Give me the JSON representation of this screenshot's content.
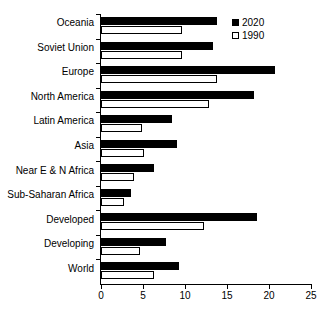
{
  "chart_data": {
    "type": "bar",
    "orientation": "horizontal",
    "title": "",
    "subtitle": "",
    "xlabel": "",
    "ylabel": "",
    "xlim": [
      0,
      25
    ],
    "xticks": [
      0,
      5,
      10,
      15,
      20,
      25
    ],
    "xtick_labels": [
      "0",
      "5",
      "10",
      "15",
      "20",
      "25"
    ],
    "grid": false,
    "legend_position": "top-right",
    "categories": [
      "Oceania",
      "Soviet Union",
      "Europe",
      "North America",
      "Latin America",
      "Asia",
      "Near E & N Africa",
      "Sub-Saharan Africa",
      "Developed",
      "Developing",
      "World"
    ],
    "series": [
      {
        "name": "2020",
        "color": "#000000",
        "style": "filled",
        "values": [
          13.8,
          13.3,
          20.7,
          18.2,
          8.5,
          9.0,
          6.3,
          3.6,
          18.6,
          7.7,
          9.3
        ]
      },
      {
        "name": "1990",
        "color": "#ffffff",
        "style": "outlined",
        "values": [
          9.6,
          9.6,
          13.8,
          12.9,
          4.9,
          5.1,
          3.9,
          2.7,
          12.3,
          4.7,
          6.3
        ]
      }
    ]
  },
  "legend": {
    "items": [
      {
        "label": "2020",
        "swatch": "filled-black-square"
      },
      {
        "label": "1990",
        "swatch": "outlined-white-square"
      }
    ]
  }
}
